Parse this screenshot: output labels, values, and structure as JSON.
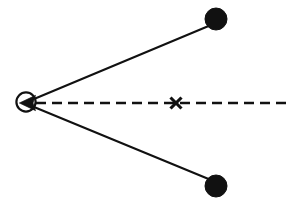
{
  "figure": {
    "background_color": "#ffffff",
    "stroke_color": "#111111",
    "width": 300,
    "height": 208
  },
  "chart_data": {
    "type": "scatter",
    "xlabel": "",
    "ylabel": "",
    "xlim": [
      0,
      300
    ],
    "ylim": [
      0,
      208
    ],
    "grid": false,
    "legend": null,
    "annotations": [
      {
        "name": "vertex",
        "shape": "open-circle",
        "x": 26,
        "y": 102,
        "radius": 10,
        "filled": false,
        "label": ""
      },
      {
        "name": "upper-node",
        "shape": "filled-circle",
        "x": 216,
        "y": 19,
        "radius": 11,
        "filled": true,
        "label": ""
      },
      {
        "name": "lower-node",
        "shape": "filled-circle",
        "x": 216,
        "y": 186,
        "radius": 11,
        "filled": true,
        "label": ""
      },
      {
        "name": "axis-cross",
        "shape": "x-mark",
        "x": 176,
        "y": 103,
        "size": 11,
        "filled": true,
        "label": ""
      },
      {
        "name": "vertex-arrowhead",
        "shape": "triangle-left",
        "x": 27,
        "y": 103,
        "size": 9,
        "filled": true,
        "label": ""
      }
    ],
    "segments": [
      {
        "name": "upper-ray",
        "style": "solid",
        "x": [
          34,
          211
        ],
        "y": [
          99,
          25
        ]
      },
      {
        "name": "lower-ray",
        "style": "solid",
        "x": [
          34,
          211
        ],
        "y": [
          107,
          180
        ]
      },
      {
        "name": "center-axis",
        "style": "dashed",
        "dash_length": 10,
        "gap_length": 6,
        "x": [
          36,
          288
        ],
        "y": [
          103,
          103
        ]
      }
    ]
  }
}
